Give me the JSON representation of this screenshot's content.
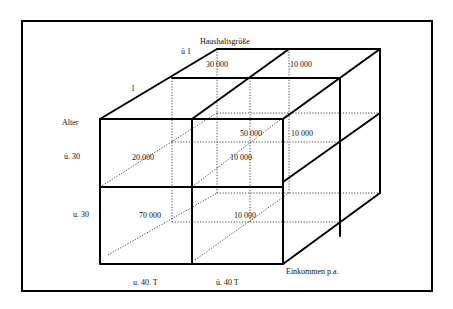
{
  "diagram": {
    "type": "3d-cube-cross-tabulation",
    "axes": {
      "vertical": {
        "title": "Alter",
        "categories": [
          "ü. 30",
          "u. 30"
        ]
      },
      "horizontal": {
        "title": "Einkommen p.a.",
        "categories": [
          "u. 40. T",
          "ü. 40 T"
        ]
      },
      "depth": {
        "title": "Haushaltsgröße",
        "categories": [
          "1",
          "ü 1"
        ]
      }
    },
    "cells": {
      "front_upper_left": "20.000",
      "front_lower_left": "70 000",
      "front_lower_right": "10 000",
      "mid_upper_right": "10 000",
      "back_upper_inner": "50 000",
      "back_upper_right": "10 000",
      "top_back_left": "30 000",
      "top_back_right": "10 000"
    },
    "colors": {
      "line": "#000000",
      "background": "#ffffff"
    }
  }
}
